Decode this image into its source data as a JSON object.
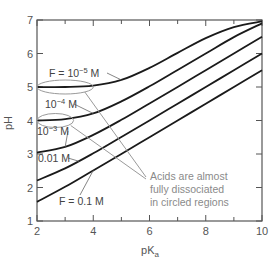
{
  "chart_data": {
    "type": "line",
    "title": "",
    "xlabel": "pK",
    "xlabel_subscript": "a",
    "ylabel": "pH",
    "xlim": [
      2,
      10
    ],
    "ylim": [
      1,
      7
    ],
    "x_ticks": [
      2,
      4,
      6,
      8,
      10
    ],
    "x_minor_ticks": [
      3,
      5,
      7,
      9
    ],
    "y_ticks": [
      1,
      2,
      3,
      4,
      5,
      6,
      7
    ],
    "grid": false,
    "x": [
      2,
      3,
      4,
      5,
      6,
      7,
      8,
      9,
      10
    ],
    "series": [
      {
        "name": "F = 10^-5 M",
        "label": "F = 10",
        "label_exp": "−5",
        "label_unit": " M",
        "values": [
          5.0,
          5.0,
          5.04,
          5.21,
          5.57,
          6.02,
          6.46,
          6.79,
          6.96
        ]
      },
      {
        "name": "10^-4 M",
        "label": "10",
        "label_exp": "−4",
        "label_unit": " M",
        "values": [
          4.0,
          4.04,
          4.21,
          4.57,
          5.02,
          5.51,
          6.0,
          6.49,
          6.9
        ]
      },
      {
        "name": "10^-3 M",
        "label": "10",
        "label_exp": "−3",
        "label_unit": " M",
        "values": [
          3.04,
          3.21,
          3.57,
          4.02,
          4.51,
          5.0,
          5.5,
          6.0,
          6.5
        ]
      },
      {
        "name": "0.01 M",
        "label": "0.01 M",
        "label_exp": "",
        "label_unit": "",
        "values": [
          2.21,
          2.57,
          3.02,
          3.51,
          4.0,
          4.5,
          5.0,
          5.5,
          6.0
        ]
      },
      {
        "name": "F = 0.1 M",
        "label": "F = 0.1 M",
        "label_exp": "",
        "label_unit": "",
        "values": [
          1.57,
          2.02,
          2.51,
          3.0,
          3.5,
          4.0,
          4.5,
          5.0,
          5.5
        ]
      }
    ],
    "annotation": {
      "lines": [
        "Acids are almost",
        "fully dissociated",
        "in circled regions"
      ],
      "circled_regions": [
        {
          "pKa_range": [
            2,
            4
          ],
          "pH": 5.0
        },
        {
          "pKa_range": [
            2,
            3.3
          ],
          "pH": 4.0
        }
      ]
    },
    "colors": {
      "curve": "#1a1a1a",
      "axis": "#555555",
      "annotation": "#9a9a9a"
    }
  }
}
